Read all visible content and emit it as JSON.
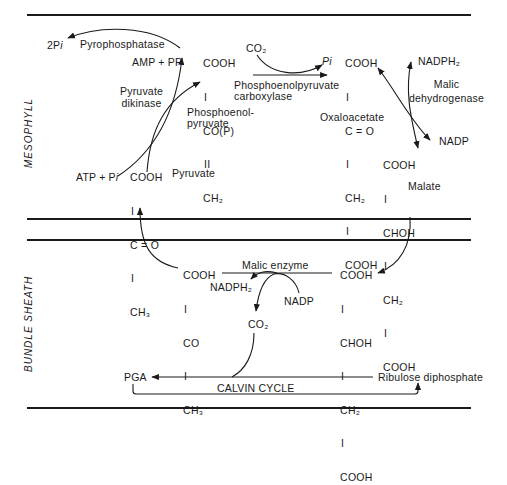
{
  "regions": {
    "mesophyll": "MESOPHYLL",
    "bundle_sheath": "BUNDLE SHEATH"
  },
  "mesophyll": {
    "pyrophosphatase": {
      "enzyme": "Pyrophosphatase",
      "product": "2P",
      "product_suffix": "i",
      "substrate": "AMP + PP"
    },
    "pyruvate_dikinase": {
      "enzyme_line1": "Pyruvate",
      "enzyme_line2": "dikinase",
      "cofactor": "ATP + P",
      "cofactor_suffix": "i"
    },
    "pep": {
      "structure": [
        "COOH",
        "I",
        "CO(P)",
        "II",
        "CH₂"
      ],
      "name_line1": "Phosphoenol-",
      "name_line2": "pyruvate"
    },
    "pep_carboxylase": {
      "co2": "CO₂",
      "pi": "P",
      "pi_suffix": "i",
      "enzyme_line1": "Phosphoenolpyruvate",
      "enzyme_line2": "carboxylase"
    },
    "oxaloacetate": {
      "structure": [
        "COOH",
        "I",
        "C = O",
        "I",
        "CH₂",
        "I",
        "COOH"
      ],
      "name": "Oxaloacetate"
    },
    "malic_dehydrogenase": {
      "enzyme_line1": "Malic",
      "enzyme_line2": "dehydrogenase",
      "cofactor_in": "NADPH₂",
      "cofactor_out": "NADP"
    },
    "malate": {
      "structure": [
        "COOH",
        "I",
        "CHOH",
        "I",
        "CH₂",
        "I",
        "COOH"
      ],
      "name": "Malate"
    },
    "pyruvate": {
      "structure": [
        "COOH",
        "I",
        "C = O",
        "I",
        "CH₃"
      ],
      "name": "Pyruvate"
    }
  },
  "bundle_sheath": {
    "pyruvate": {
      "structure": [
        "COOH",
        "I",
        "CO",
        "I",
        "CH₃"
      ]
    },
    "malic_enzyme": {
      "enzyme": "Malic enzyme",
      "cofactor_out": "NADPH₂",
      "cofactor_in": "NADP",
      "co2": "CO₂"
    },
    "malate": {
      "structure": [
        "COOH",
        "I",
        "CHOH",
        "I",
        "CH₂",
        "I",
        "COOH"
      ]
    },
    "calvin_cycle": {
      "label": "CALVIN CYCLE",
      "pga": "PGA",
      "rudp": "Ribulose diphosphate"
    }
  },
  "colors": {
    "ink": "#1a1a1a",
    "background": "#ffffff"
  }
}
